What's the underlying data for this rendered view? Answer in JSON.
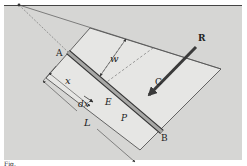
{
  "figure": {
    "type": "engineering-mechanics diagram",
    "colors": {
      "panel_bg": "#d6d6d4",
      "plate_fill": "#e4e4e2",
      "line": "#333333",
      "bar_fill": "#a8a8a6",
      "arrow": "#3a3a3a"
    }
  },
  "labels": {
    "A": "A",
    "B": "B",
    "C": "C",
    "E": "E",
    "P": "P",
    "R": "R",
    "w": "w",
    "x": "x",
    "dx": "dx",
    "L": "L"
  },
  "caption_fragment": "Fig."
}
